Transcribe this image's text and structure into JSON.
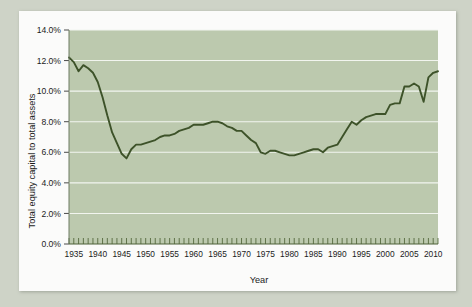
{
  "chart_data": {
    "type": "line",
    "title": "",
    "xlabel": "Year",
    "ylabel": "Total equity capital to total assets",
    "xlim": [
      1934,
      2011
    ],
    "ylim": [
      0.0,
      14.0
    ],
    "y_tick_labels": [
      "0.0%",
      "2.0%",
      "4.0%",
      "6.0%",
      "8.0%",
      "10.0%",
      "12.0%",
      "14.0%"
    ],
    "y_tick_values": [
      0.0,
      2.0,
      4.0,
      6.0,
      8.0,
      10.0,
      12.0,
      14.0
    ],
    "x_tick_labels": [
      "1935",
      "1940",
      "1945",
      "1950",
      "1955",
      "1960",
      "1965",
      "1970",
      "1975",
      "1980",
      "1985",
      "1990",
      "1995",
      "2000",
      "2005",
      "2010"
    ],
    "x_tick_values": [
      1935,
      1940,
      1945,
      1950,
      1955,
      1960,
      1965,
      1970,
      1975,
      1980,
      1985,
      1990,
      1995,
      2000,
      2005,
      2010
    ],
    "x_minor_tick_step": 1,
    "grid": "horizontal-only",
    "legend": "none",
    "units": "percent",
    "colors": {
      "line": "#3d5229",
      "plot_background": "#bcc9ae",
      "gridline": "#f2f5ef",
      "card_background": "#fbfbfa",
      "page_background": "#ced3c7",
      "axis_text": "#1b1b1b"
    },
    "series": [
      {
        "name": "Total equity capital to total assets",
        "x": [
          1934,
          1935,
          1936,
          1937,
          1938,
          1939,
          1940,
          1941,
          1942,
          1943,
          1944,
          1945,
          1946,
          1947,
          1948,
          1949,
          1950,
          1951,
          1952,
          1953,
          1954,
          1955,
          1956,
          1957,
          1958,
          1959,
          1960,
          1961,
          1962,
          1963,
          1964,
          1965,
          1966,
          1967,
          1968,
          1969,
          1970,
          1971,
          1972,
          1973,
          1974,
          1975,
          1976,
          1977,
          1978,
          1979,
          1980,
          1981,
          1982,
          1983,
          1984,
          1985,
          1986,
          1987,
          1988,
          1989,
          1990,
          1991,
          1992,
          1993,
          1994,
          1995,
          1996,
          1997,
          1998,
          1999,
          2000,
          2001,
          2002,
          2003,
          2004,
          2005,
          2006,
          2007,
          2008,
          2009,
          2010,
          2011
        ],
        "values": [
          12.2,
          11.9,
          11.3,
          11.7,
          11.5,
          11.2,
          10.6,
          9.6,
          8.4,
          7.3,
          6.6,
          5.9,
          5.6,
          6.2,
          6.5,
          6.5,
          6.6,
          6.7,
          6.8,
          7.0,
          7.1,
          7.1,
          7.2,
          7.4,
          7.5,
          7.6,
          7.8,
          7.8,
          7.8,
          7.9,
          8.0,
          8.0,
          7.9,
          7.7,
          7.6,
          7.4,
          7.4,
          7.1,
          6.8,
          6.6,
          6.0,
          5.9,
          6.1,
          6.1,
          6.0,
          5.9,
          5.8,
          5.8,
          5.9,
          6.0,
          6.1,
          6.2,
          6.2,
          6.0,
          6.3,
          6.4,
          6.5,
          7.0,
          7.5,
          8.0,
          7.8,
          8.1,
          8.3,
          8.4,
          8.5,
          8.5,
          8.5,
          9.1,
          9.2,
          9.2,
          10.3,
          10.3,
          10.5,
          10.3,
          9.3,
          10.9,
          11.2,
          11.3
        ]
      }
    ]
  }
}
